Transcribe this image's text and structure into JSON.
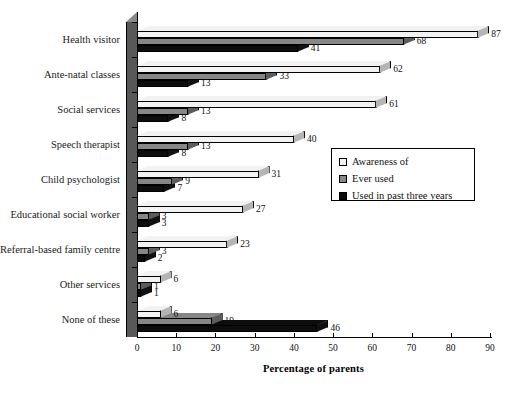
{
  "chart_data": {
    "type": "bar",
    "orientation": "horizontal",
    "title": "",
    "xlabel": "Percentage of parents",
    "ylabel": "",
    "xlim": [
      0,
      90
    ],
    "xticks": [
      0,
      10,
      20,
      30,
      40,
      50,
      60,
      70,
      80,
      90
    ],
    "grid": false,
    "legend_position": "center-right",
    "categories": [
      "Health visitor",
      "Ante-natal classes",
      "Social services",
      "Speech therapist",
      "Child psychologist",
      "Educational social worker",
      "Referral-based family centre",
      "Other services",
      "None of these"
    ],
    "series": [
      {
        "name": "Awareness of",
        "color": "#f2f2f2",
        "values": [
          87,
          62,
          61,
          40,
          31,
          27,
          23,
          6,
          6
        ]
      },
      {
        "name": "Ever used",
        "color": "#878787",
        "values": [
          68,
          33,
          13,
          13,
          9,
          3,
          3,
          1,
          19
        ]
      },
      {
        "name": "Used in past three years",
        "color": "#0d0d0d",
        "values": [
          41,
          13,
          8,
          8,
          7,
          3,
          2,
          1,
          46
        ]
      }
    ]
  },
  "legend": {
    "items": [
      {
        "label": "Awareness of",
        "swatch": "#f2f2f2"
      },
      {
        "label": "Ever used",
        "swatch": "#878787"
      },
      {
        "label": "Used in past three years",
        "swatch": "#0d0d0d"
      }
    ]
  },
  "axis": {
    "x_title": "Percentage of parents",
    "x_tick_labels": [
      "0",
      "10",
      "20",
      "30",
      "40",
      "50",
      "60",
      "70",
      "80",
      "90"
    ]
  },
  "colors": {
    "awareness": "#f2f2f2",
    "ever_used": "#878787",
    "recent_used": "#0d0d0d",
    "axis": "#000000",
    "wall": "#585858",
    "wall_top": "#8a8a8a"
  }
}
